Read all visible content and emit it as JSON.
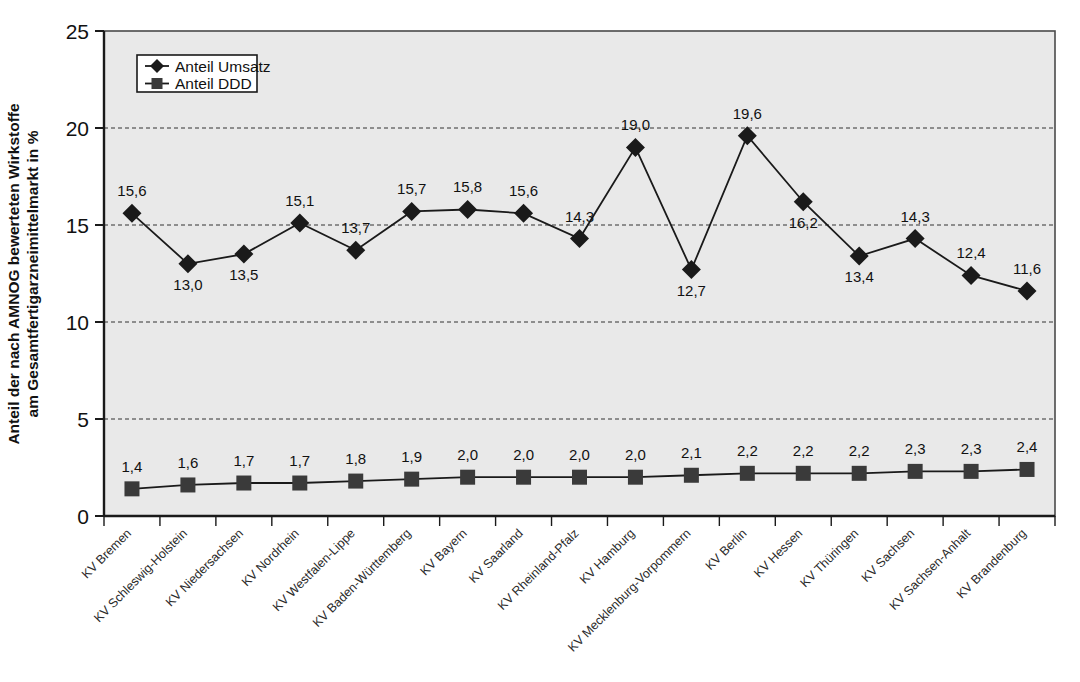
{
  "chart_data": {
    "type": "line",
    "title": "",
    "xlabel": "",
    "ylabel": "Anteil der nach AMNOG bewerteten Wirkstoffe am Gesamtfertigarzneimittelmarkt in %",
    "ylim": [
      0,
      25
    ],
    "yticks": [
      0,
      5,
      10,
      15,
      20,
      25
    ],
    "ytick_labels": [
      "0",
      "5",
      "10",
      "15",
      "20",
      "25"
    ],
    "grid": "horizontal-dashed",
    "legend_position": "top-left-inside",
    "decimal_separator": ",",
    "plot_background": "#e9e9e9",
    "series_color": "#1a1a1a",
    "categories": [
      "KV Bremen",
      "KV Schleswig-Holstein",
      "KV Niedersachsen",
      "KV Nordrhein",
      "KV Westfalen-Lippe",
      "KV Baden-Württemberg",
      "KV Bayern",
      "KV Saarland",
      "KV Rheinland-Pfalz",
      "KV Hamburg",
      "KV Mecklenburg-Vorpommern",
      "KV Berlin",
      "KV Hessen",
      "KV Thüringen",
      "KV Sachsen",
      "KV Sachsen-Anhalt",
      "KV Brandenburg"
    ],
    "series": [
      {
        "name": "Anteil Umsatz",
        "marker": "diamond",
        "values": [
          15.6,
          13.0,
          13.5,
          15.1,
          13.7,
          15.7,
          15.8,
          15.6,
          14.3,
          19.0,
          12.7,
          19.6,
          16.2,
          13.4,
          14.3,
          12.4,
          11.6
        ],
        "labels": [
          "15,6",
          "13,0",
          "13,5",
          "15,1",
          "13,7",
          "15,7",
          "15,8",
          "15,6",
          "14,3",
          "19,0",
          "12,7",
          "19,6",
          "16,2",
          "13,4",
          "14,3",
          "12,4",
          "11,6"
        ],
        "label_positions": [
          "above",
          "below",
          "below",
          "above",
          "above",
          "above",
          "above",
          "above",
          "above",
          "above",
          "below",
          "above",
          "below",
          "below",
          "above",
          "above",
          "above"
        ]
      },
      {
        "name": "Anteil DDD",
        "marker": "square",
        "values": [
          1.4,
          1.6,
          1.7,
          1.7,
          1.8,
          1.9,
          2.0,
          2.0,
          2.0,
          2.0,
          2.1,
          2.2,
          2.2,
          2.2,
          2.3,
          2.3,
          2.4
        ],
        "labels": [
          "1,4",
          "1,6",
          "1,7",
          "1,7",
          "1,8",
          "1,9",
          "2,0",
          "2,0",
          "2,0",
          "2,0",
          "2,1",
          "2,2",
          "2,2",
          "2,2",
          "2,3",
          "2,3",
          "2,4"
        ],
        "label_positions": [
          "above",
          "above",
          "above",
          "above",
          "above",
          "above",
          "above",
          "above",
          "above",
          "above",
          "above",
          "above",
          "above",
          "above",
          "above",
          "above",
          "above"
        ]
      }
    ],
    "legend": [
      {
        "label": "Anteil Umsatz",
        "marker": "diamond"
      },
      {
        "label": "Anteil DDD",
        "marker": "square"
      }
    ]
  }
}
